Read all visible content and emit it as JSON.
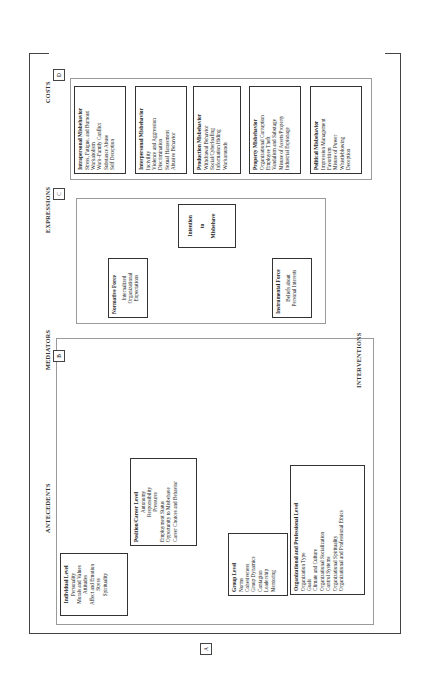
{
  "sections": {
    "antecedents": "ANTECEDENTS",
    "mediators": "MEDIATORS",
    "expressions": "EXPRESSIONS",
    "costs": "COSTS",
    "interventions": "INTERVENTIONS"
  },
  "antecedents": [
    {
      "title": "Individual Level",
      "items": [
        "Personality",
        "Morals and Values",
        "Attitudes",
        "Affect and Emotion",
        "Stress",
        "Spirituality"
      ]
    },
    {
      "title": "Position/Career Level",
      "items": [
        "Autonomy",
        "Responsibility",
        "Pressures",
        "Employment Status",
        "Opportunity to Misbehave",
        "Career Choices and Behavior"
      ]
    },
    {
      "title": "Group Level",
      "items": [
        "Norms",
        "Cohesiveness",
        "Group Dynamics",
        "Contagion",
        "Leadership",
        "Mentoring"
      ]
    },
    {
      "title": "Organizational and Professional Level",
      "items": [
        "Organization Type",
        "Goals",
        "Climate and Culture",
        "Organizational Socialization",
        "Control Systems",
        "Organizational Spirituality",
        "Organizational and Professional Ethics"
      ]
    }
  ],
  "mediators": {
    "normative": {
      "title": "Normative Force",
      "items": [
        "Internalized",
        "Organizational",
        "Expectations"
      ]
    },
    "instrumental": {
      "title": "Instrumental Force",
      "items": [
        "Beliefs about",
        "Personal Interests"
      ]
    },
    "intention": {
      "lines": [
        "Intention",
        "to",
        "Misbehave"
      ]
    }
  },
  "expressions": [
    {
      "title": "Intrapersonal Misbehavior",
      "items": [
        "Stress, Fatigue, and Burnout",
        "Workaholism",
        "Work–Family Conflict",
        "Substance Abuse",
        "Self Deception"
      ]
    },
    {
      "title": "Interpersonal Misbehavior",
      "items": [
        "Incivility",
        "Violence and Aggression",
        "Discrimination",
        "Sexual Harassment",
        "Abusive Behavior"
      ]
    },
    {
      "title": "Production Misbehavior",
      "items": [
        "Withdrawal Behavior",
        "Social/Cyberloafing",
        "Information Hiding",
        "Workarounds"
      ]
    },
    {
      "title": "Property Misbehavior",
      "items": [
        "Organizational Corruption",
        "Employee Theft",
        "Vandalism and Sabotage",
        "Misuse of Assets/Property",
        "Industrial Espionage"
      ]
    },
    {
      "title": "Political Misbehavior",
      "items": [
        "Impression Management",
        "Favoritism",
        "Misuse of Power",
        "Whistleblowing",
        "Deception"
      ]
    }
  ],
  "costs": [
    {
      "title": "Financial Costs",
      "items": [
        "Productivity Loss",
        "Lawsuits and Compensation",
        "Reputation"
      ]
    },
    {
      "title": "Personal and Social Costs",
      "items": [
        "Mental and Physical Injuries",
        "Psychological Withdrawal",
        "Job Dissatisfaction",
        "Career Failure"
      ]
    }
  ],
  "interventions": {
    "groups": [
      {
        "title": "Aimed at Antecedents:",
        "items": [
          "Selection",
          "Education and Training",
          "Job Redesign",
          "Career Management"
        ]
      },
      {
        "title": "Aimed at Expressions:",
        "items": [
          "Reward and Punishment",
          "Termination",
          "EAPs"
        ]
      }
    ]
  },
  "markers": {
    "a": "A",
    "b": "B",
    "c": "C",
    "d": "D"
  },
  "colors": {
    "line": "#444444",
    "dashed_border": "#9a9a9a",
    "box_border": "#333333",
    "background": "#ffffff"
  }
}
